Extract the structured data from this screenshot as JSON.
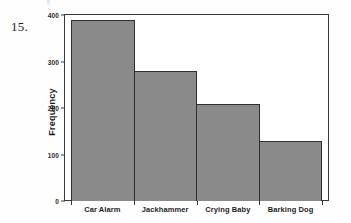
{
  "question": {
    "number": "15."
  },
  "chart_data": {
    "type": "bar",
    "title": "",
    "xlabel": "",
    "ylabel": "Frequency",
    "categories": [
      "Car Alarm",
      "Jackhammer",
      "Crying Baby",
      "Barking Dog"
    ],
    "values": [
      390,
      280,
      208,
      128
    ],
    "ylim": [
      0,
      400
    ],
    "yticks": [
      0,
      100,
      200,
      300,
      400
    ],
    "ytick_labels": [
      "0",
      "100",
      "200",
      "300",
      "400"
    ],
    "grid": false,
    "legend": null,
    "bar_color": "#8a8a8a",
    "bar_edge_color": "#2f2f2f",
    "axis_color": "#3a3a3a",
    "background_color": "#fefefe"
  }
}
